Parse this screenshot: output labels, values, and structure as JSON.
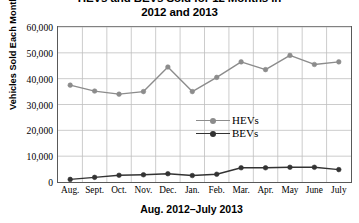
{
  "chart_data": {
    "type": "line",
    "title": "HEVs and BEVs Sold for 12 Months in 2012 and 2013",
    "title_line1": "HEVs and BEVs Sold for 12 Months in",
    "title_line2": "2012 and 2013",
    "xlabel": "Aug. 2012–July 2013",
    "ylabel": "Vehicles Sold Each Month",
    "categories": [
      "Aug.",
      "Sept.",
      "Oct.",
      "Nov.",
      "Dec.",
      "Jan.",
      "Feb.",
      "Mar.",
      "Apr.",
      "May",
      "June",
      "July"
    ],
    "ylim": [
      0,
      60000
    ],
    "ytick_values": [
      0,
      10000,
      20000,
      30000,
      40000,
      50000,
      60000
    ],
    "ytick_labels": [
      "0",
      "10,000",
      "20,000",
      "30,000",
      "40,000",
      "50,000",
      "60,000"
    ],
    "grid": "both",
    "legend_position": "center",
    "series": [
      {
        "name": "HEVs",
        "color": "#8c8c8c",
        "marker": "circle",
        "values": [
          37500,
          35200,
          34000,
          35000,
          44500,
          35000,
          40500,
          46500,
          43500,
          49000,
          45500,
          46500
        ]
      },
      {
        "name": "BEVs",
        "color": "#333333",
        "marker": "circle-filled",
        "values": [
          1000,
          1800,
          2600,
          2800,
          3200,
          2500,
          3000,
          5500,
          5500,
          5700,
          5700,
          4800
        ]
      }
    ]
  },
  "legend": {
    "items": [
      {
        "label": "HEVs"
      },
      {
        "label": "BEVs"
      }
    ]
  },
  "colors": {
    "hevs": "#8c8c8c",
    "bevs": "#333333",
    "grid": "#bfbfbf",
    "axis": "#595959",
    "text": "#000000",
    "background": "#ffffff"
  }
}
